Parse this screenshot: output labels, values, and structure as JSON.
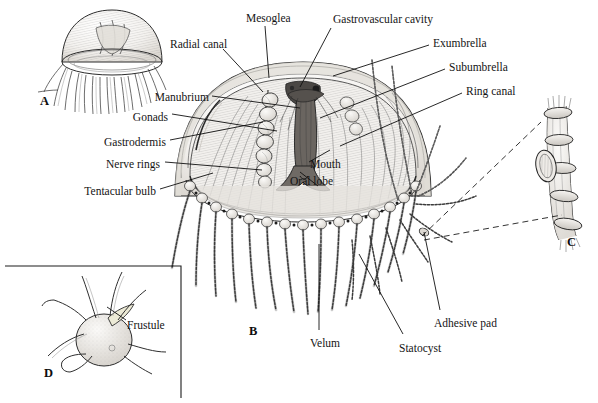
{
  "figure": {
    "background_color": "#ffffff",
    "ink_color": "#1a1a1a",
    "fill_tint": "#e8e6e2"
  },
  "panels": [
    {
      "id": "A",
      "letter": "A",
      "x": 40,
      "y": 95,
      "caption": "whole medusa, external view"
    },
    {
      "id": "B",
      "letter": "B",
      "x": 249,
      "y": 325,
      "caption": "cutaway medusa, internal anatomy"
    },
    {
      "id": "C",
      "letter": "C",
      "x": 567,
      "y": 236,
      "caption": "tentacle detail with adhesive pad"
    },
    {
      "id": "D",
      "letter": "D",
      "x": 44,
      "y": 367,
      "caption": "frustule / polyp stage"
    }
  ],
  "labels": [
    {
      "id": "mesoglea",
      "text": "Mesoglea",
      "x": 246,
      "y": 13,
      "align": "left"
    },
    {
      "id": "gastrovascular",
      "text": "Gastrovascular cavity",
      "x": 333,
      "y": 14,
      "align": "left"
    },
    {
      "id": "exumbrella",
      "text": "Exumbrella",
      "x": 433,
      "y": 38,
      "align": "left"
    },
    {
      "id": "subumbrella",
      "text": "Subumbrella",
      "x": 449,
      "y": 62,
      "align": "left"
    },
    {
      "id": "ring-canal",
      "text": "Ring canal",
      "x": 466,
      "y": 86,
      "align": "left"
    },
    {
      "id": "radial-canal",
      "text": "Radial canal",
      "x": 170,
      "y": 39,
      "align": "left"
    },
    {
      "id": "manubrium",
      "text": "Manubrium",
      "x": 209,
      "y": 92,
      "align": "right"
    },
    {
      "id": "gonads",
      "text": "Gonads",
      "x": 168,
      "y": 112,
      "align": "right"
    },
    {
      "id": "gastrodermis",
      "text": "Gastrodermis",
      "x": 166,
      "y": 137,
      "align": "right"
    },
    {
      "id": "nerve-rings",
      "text": "Nerve rings",
      "x": 160,
      "y": 159,
      "align": "right"
    },
    {
      "id": "tentacular-bulb",
      "text": "Tentacular bulb",
      "x": 156,
      "y": 186,
      "align": "right"
    },
    {
      "id": "mouth",
      "text": "Mouth",
      "x": 310,
      "y": 159,
      "align": "left"
    },
    {
      "id": "oral-lobe",
      "text": "Oral lobe",
      "x": 290,
      "y": 176,
      "align": "left"
    },
    {
      "id": "velum",
      "text": "Velum",
      "x": 310,
      "y": 338,
      "align": "left"
    },
    {
      "id": "statocyst",
      "text": "Statocyst",
      "x": 399,
      "y": 343,
      "align": "left"
    },
    {
      "id": "adhesive-pad",
      "text": "Adhesive pad",
      "x": 434,
      "y": 318,
      "align": "left"
    },
    {
      "id": "frustule",
      "text": "Frustule",
      "x": 127,
      "y": 320,
      "align": "left"
    }
  ],
  "leader_lines": [
    {
      "id": "mesoglea-leader",
      "points": "265,26 269,78"
    },
    {
      "id": "gastrovascular-leader",
      "points": "331,28 300,87"
    },
    {
      "id": "exumbrella-leader",
      "points": "429,45 333,76"
    },
    {
      "id": "subumbrella-leader",
      "points": "445,69 320,118"
    },
    {
      "id": "ring-canal-leader",
      "points": "462,93 340,146"
    },
    {
      "id": "radial-canal-leader",
      "points": "223,49 263,92"
    },
    {
      "id": "manubrium-leader",
      "points": "212,96 300,108"
    },
    {
      "id": "gonads-leader",
      "points": "172,114 277,131"
    },
    {
      "id": "gastrodermis-leader",
      "points": "170,140 263,122"
    },
    {
      "id": "nerve-rings-leader",
      "points": "165,162 262,170"
    },
    {
      "id": "tentacular-bulb-leader",
      "points": "160,189 213,173"
    },
    {
      "id": "velum-leader",
      "points": "319,330 319,244"
    },
    {
      "id": "statocyst-leader",
      "points": "403,334 359,254"
    },
    {
      "id": "adhesive-pad-leader",
      "points": "440,310 424,232"
    },
    {
      "id": "frustule-leader",
      "points": "126,320 107,307"
    }
  ],
  "dashed_connectors": [
    {
      "id": "inset-c-upper",
      "points": "422,236 541,122"
    },
    {
      "id": "inset-c-lower",
      "points": "424,240 562,215"
    }
  ],
  "inset_boxes": [
    {
      "id": "panel-d-box",
      "x": 5,
      "y": 266,
      "width": 176,
      "height": 132
    }
  ]
}
